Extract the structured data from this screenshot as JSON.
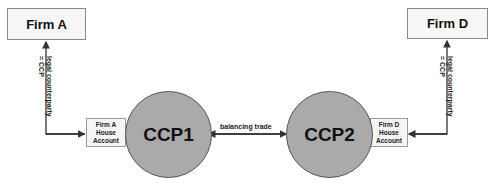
{
  "diagram": {
    "firms": [
      {
        "id": "firm-a",
        "label": "Firm A"
      },
      {
        "id": "firm-d",
        "label": "Firm D"
      }
    ],
    "house_accounts": [
      {
        "id": "firm-a-house",
        "label": "Firm A\nHouse\nAccount"
      },
      {
        "id": "firm-d-house",
        "label": "Firm D\nHouse\nAccount"
      }
    ],
    "ccps": [
      {
        "id": "ccp1",
        "label": "CCP1"
      },
      {
        "id": "ccp2",
        "label": "CCP2"
      }
    ],
    "edges": [
      {
        "from": "firm-a-house",
        "to": "firm-a",
        "label_line1": "legal counterparty",
        "label_line2": "= CCP"
      },
      {
        "from": "firm-d-house",
        "to": "firm-d",
        "label_line1": "legal counterparty",
        "label_line2": "= CCP"
      },
      {
        "from": "ccp1",
        "to": "ccp2",
        "label": "balancing trade",
        "bidirectional": true
      }
    ],
    "colors": {
      "circle_fill": "#aaaaaa",
      "box_fill": "#f7f7f7",
      "line": "#333333"
    }
  }
}
